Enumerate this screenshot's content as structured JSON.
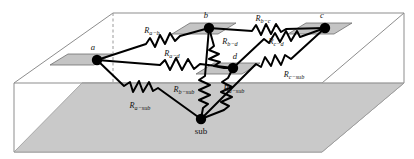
{
  "figure": {
    "type": "3d-resistor-network-diagram"
  },
  "colors": {
    "background": "#ffffff",
    "box_outline": "#8d8d8d",
    "ground_plane": "#c9c9c9",
    "ground_plane_outline": "#9a9a9a",
    "contact_plate": "#c4c4c4",
    "contact_plate_outline": "#6f6f6f",
    "wire": "#000000",
    "node": "#000000",
    "text": "#111111"
  },
  "nodes": [
    {
      "id": "a",
      "label": "a",
      "x": 97,
      "y": 60,
      "label_x": 93,
      "label_y": 50,
      "type": "contact",
      "plate": true
    },
    {
      "id": "b",
      "label": "b",
      "x": 209,
      "y": 28,
      "label_x": 206,
      "label_y": 18,
      "type": "contact",
      "plate": true
    },
    {
      "id": "c",
      "label": "c",
      "x": 325,
      "y": 28,
      "label_x": 322,
      "label_y": 18,
      "type": "contact",
      "plate": true
    },
    {
      "id": "d",
      "label": "d",
      "x": 233,
      "y": 68,
      "label_x": 235,
      "label_y": 59,
      "type": "contact",
      "plate": true
    },
    {
      "id": "sub",
      "label": "sub",
      "x": 201,
      "y": 119,
      "label_x": 201,
      "label_y": 134,
      "type": "substrate",
      "plate": false
    }
  ],
  "resistors": [
    {
      "id": "R_a-b",
      "base": "R",
      "sub": "a−b",
      "from": "a",
      "to": "b",
      "label_x": 152,
      "label_y": 33
    },
    {
      "id": "R_a-d",
      "base": "R",
      "sub": "a−d",
      "from": "a",
      "to": "d",
      "label_x": 172,
      "label_y": 56
    },
    {
      "id": "R_b-c",
      "base": "R",
      "sub": "b−c",
      "from": "b",
      "to": "c",
      "label_x": 263,
      "label_y": 21
    },
    {
      "id": "R_b-d",
      "base": "R",
      "sub": "b−d",
      "from": "b",
      "to": "d",
      "label_x": 230,
      "label_y": 44
    },
    {
      "id": "R_c-d",
      "base": "R",
      "sub": "c−d",
      "from": "c",
      "to": "d",
      "label_x": 276,
      "label_y": 44
    },
    {
      "id": "R_a-sub",
      "base": "R",
      "sub": "a−sub",
      "from": "a",
      "to": "sub",
      "label_x": 140,
      "label_y": 108
    },
    {
      "id": "R_b-sub",
      "base": "R",
      "sub": "b−sub",
      "from": "b",
      "to": "sub",
      "label_x": 184,
      "label_y": 92
    },
    {
      "id": "R_d-sub",
      "base": "R",
      "sub": "d−sub",
      "from": "d",
      "to": "sub",
      "label_x": 234,
      "label_y": 91
    },
    {
      "id": "R_c-sub",
      "base": "R",
      "sub": "c−sub",
      "from": "c",
      "to": "sub",
      "label_x": 294,
      "label_y": 77
    }
  ],
  "geometry": {
    "box_description": "open wireframe slab with gray substrate ground plane",
    "box_front_bottom_left_x": 14,
    "box_front_bottom_right_x": 322,
    "box_top_y": 13,
    "box_bottom_y": 152
  }
}
